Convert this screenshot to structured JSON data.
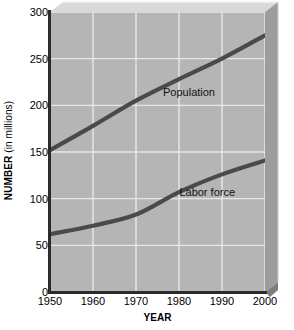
{
  "chart_data": {
    "type": "line",
    "title": "",
    "xlabel": "YEAR",
    "ylabel": "NUMBER (in millions)",
    "ylabel_bold_part": "NUMBER",
    "ylabel_regular_part": "(in millions)",
    "x": [
      1950,
      1960,
      1970,
      1980,
      1990,
      2000
    ],
    "xtick_labels": [
      "1950",
      "1960",
      "1970",
      "1980",
      "1990",
      "2000"
    ],
    "ytick_labels": [
      "0",
      "50",
      "100",
      "150",
      "200",
      "250",
      "300"
    ],
    "yticks": [
      0,
      50,
      100,
      150,
      200,
      250,
      300
    ],
    "xlim": [
      1950,
      2000
    ],
    "ylim": [
      0,
      300
    ],
    "grid": true,
    "grid_color": "#e8e8e8",
    "plot_bg_color": "#b5b5b5",
    "line_color": "#4a4a4a",
    "axis_color": "#2b2b2b",
    "legend_position": "inline-annotations",
    "series": [
      {
        "name": "Population",
        "label": "Population",
        "values": [
          152,
          178,
          205,
          228,
          250,
          275
        ],
        "label_x": 1980,
        "label_y": 213
      },
      {
        "name": "Labor force",
        "label": "Labor force",
        "values": [
          62,
          71,
          83,
          107,
          126,
          141
        ],
        "label_x": 1988,
        "label_y": 106
      }
    ],
    "annotations": [
      "Population",
      "Labor force"
    ]
  },
  "axes": {
    "x_title": "YEAR",
    "y_title_bold": "NUMBER",
    "y_title_regular": " (in millions)"
  }
}
